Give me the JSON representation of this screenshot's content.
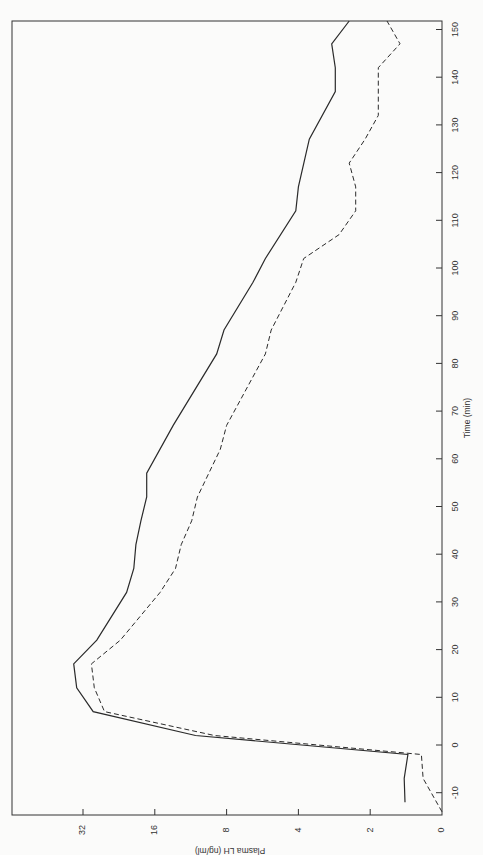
{
  "chart_data": {
    "type": "line",
    "orientation": "rotated-90-clockwise",
    "title": "",
    "xlabel": "Time (min)",
    "ylabel": "Plasma LH (ng/ml)",
    "x_ticks": [
      -10,
      0,
      10,
      20,
      30,
      40,
      50,
      60,
      70,
      80,
      90,
      100,
      110,
      120,
      130,
      140,
      150
    ],
    "y_ticks": [
      {
        "label": "0",
        "value": 1
      },
      {
        "label": "2",
        "value": 2
      },
      {
        "label": "4",
        "value": 4
      },
      {
        "label": "8",
        "value": 8
      },
      {
        "label": "16",
        "value": 16
      },
      {
        "label": "32",
        "value": 32
      }
    ],
    "y_scale": "log2",
    "xlim": [
      -15,
      152
    ],
    "ylim": [
      1,
      64
    ],
    "grid": false,
    "legend": null,
    "series": [
      {
        "name": "solid",
        "style": "solid",
        "x": [
          -12,
          -7,
          -2,
          2,
          7,
          12,
          17,
          22,
          32,
          37,
          42,
          47,
          52,
          57,
          67,
          82,
          87,
          97,
          102,
          112,
          117,
          127,
          137,
          142,
          147,
          152
        ],
        "values": [
          1.43,
          1.44,
          1.39,
          10.8,
          29,
          34,
          35,
          28,
          21,
          19.6,
          19.2,
          18.3,
          17.3,
          17.3,
          13.4,
          8.8,
          8.2,
          6.2,
          5.5,
          4.1,
          4.0,
          3.6,
          2.8,
          2.8,
          2.9,
          2.45
        ]
      },
      {
        "name": "dashed",
        "style": "dashed",
        "x": [
          -14,
          -7,
          -2,
          2,
          7,
          12,
          17,
          22,
          32,
          37,
          42,
          47,
          52,
          62,
          67,
          82,
          87,
          97,
          102,
          107,
          112,
          117,
          122,
          127,
          132,
          142,
          147,
          152
        ],
        "values": [
          1.0,
          1.2,
          1.22,
          9,
          26,
          28.7,
          29.5,
          22.3,
          15.2,
          13.1,
          12.4,
          11.2,
          10.6,
          8.5,
          8.0,
          5.5,
          5.2,
          4.1,
          3.8,
          2.7,
          2.3,
          2.3,
          2.45,
          2.1,
          1.85,
          1.85,
          1.5,
          1.7
        ]
      }
    ]
  },
  "colors": {
    "background": "#fbfbfa",
    "line": "#2a2a2a",
    "axis": "#333333"
  }
}
